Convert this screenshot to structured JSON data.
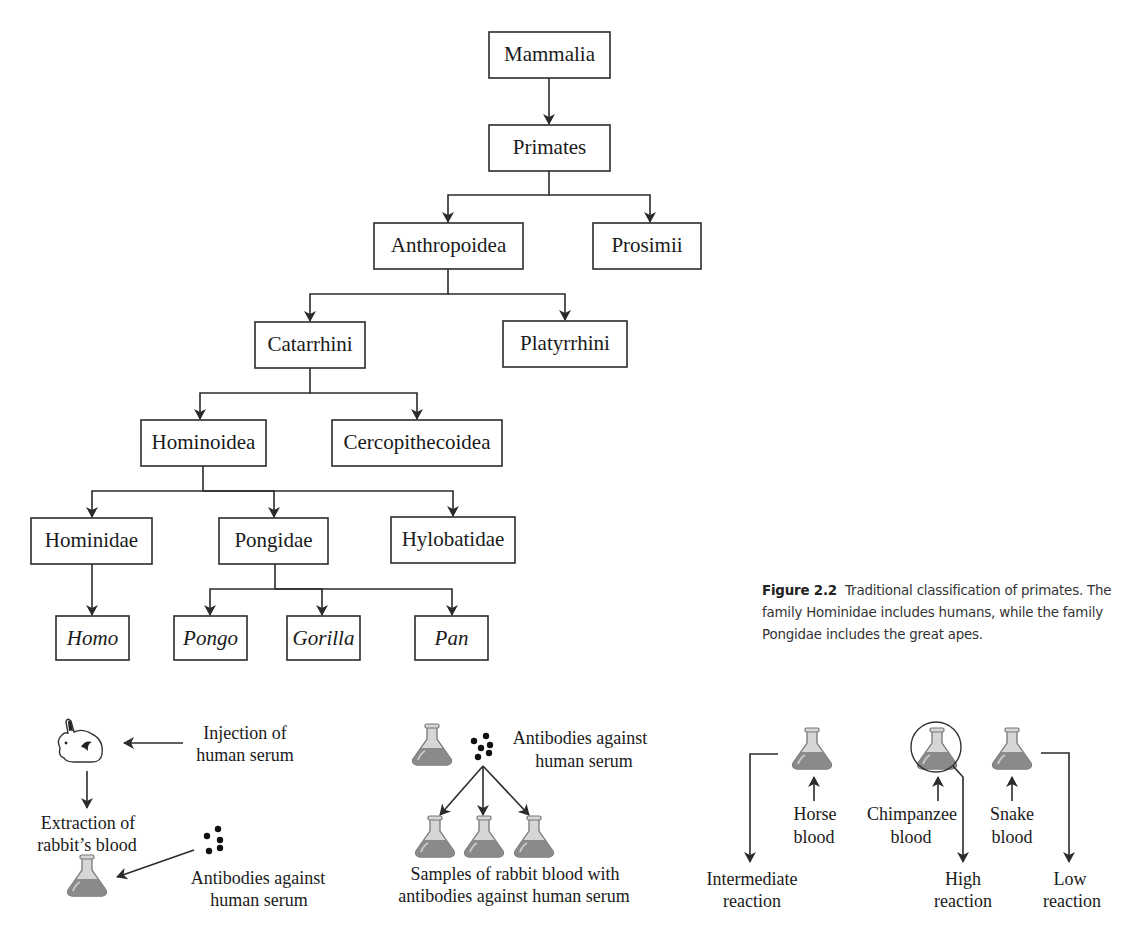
{
  "figure": {
    "number": "Figure 2.2",
    "caption": "Traditional classification of primates. The family Hominidae includes humans, while the family Pongidae includes the great apes."
  },
  "tree": {
    "nodes": {
      "mammalia": "Mammalia",
      "primates": "Primates",
      "anthropoidea": "Anthropoidea",
      "prosimii": "Prosimii",
      "catarrhini": "Catarrhini",
      "platyrrhini": "Platyrrhini",
      "hominoidea": "Hominoidea",
      "cercopithecoidea": "Cercopithecoidea",
      "hominidae": "Hominidae",
      "pongidae": "Pongidae",
      "hylobatidae": "Hylobatidae",
      "homo": "Homo",
      "pongo": "Pongo",
      "gorilla": "Gorilla",
      "pan": "Pan"
    },
    "edges": [
      [
        "Mammalia",
        "Primates"
      ],
      [
        "Primates",
        "Anthropoidea"
      ],
      [
        "Primates",
        "Prosimii"
      ],
      [
        "Anthropoidea",
        "Catarrhini"
      ],
      [
        "Anthropoidea",
        "Platyrrhini"
      ],
      [
        "Catarrhini",
        "Hominoidea"
      ],
      [
        "Catarrhini",
        "Cercopithecoidea"
      ],
      [
        "Hominoidea",
        "Hominidae"
      ],
      [
        "Hominoidea",
        "Pongidae"
      ],
      [
        "Hominoidea",
        "Hylobatidae"
      ],
      [
        "Hominidae",
        "Homo"
      ],
      [
        "Pongidae",
        "Pongo"
      ],
      [
        "Pongidae",
        "Gorilla"
      ],
      [
        "Pongidae",
        "Pan"
      ]
    ]
  },
  "process": {
    "step1": {
      "injection_line1": "Injection of",
      "injection_line2": "human serum",
      "extraction_line1": "Extraction of",
      "extraction_line2": "rabbit’s blood",
      "antibodies_line1": "Antibodies against",
      "antibodies_line2": "human serum",
      "icons": [
        "rabbit-icon",
        "flask-icon",
        "antibody-dots-icon"
      ]
    },
    "step2": {
      "antibodies_line1": "Antibodies against",
      "antibodies_line2": "human serum",
      "samples_line1": "Samples of rabbit blood with",
      "samples_line2": "antibodies against human serum"
    },
    "step3": {
      "tests": [
        {
          "blood_line1": "Horse",
          "blood_line2": "blood",
          "reaction_line1": "Intermediate",
          "reaction_line2": "reaction"
        },
        {
          "blood_line1": "Chimpanzee",
          "blood_line2": "blood",
          "reaction_line1": "High",
          "reaction_line2": "reaction"
        },
        {
          "blood_line1": "Snake",
          "blood_line2": "blood",
          "reaction_line1": "Low",
          "reaction_line2": "reaction"
        }
      ]
    }
  },
  "colors": {
    "line": "#2b2b2b",
    "flask_liquid": "#8a8a8a",
    "flask_glass": "#d6d6d6",
    "text": "#1a1a1a"
  }
}
